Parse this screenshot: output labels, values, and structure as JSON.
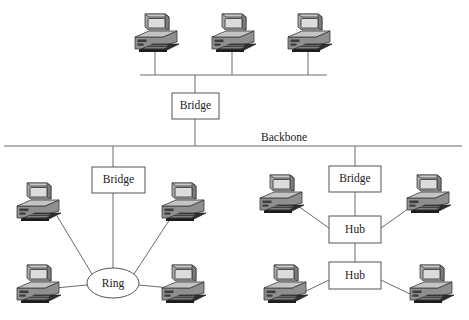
{
  "diagram": {
    "canvas": {
      "width": 469,
      "height": 320
    },
    "colors": {
      "background": "#ffffff",
      "line": "#6b6b6b",
      "box_stroke": "#555555",
      "text": "#1a1a1a",
      "monitor_screen": "#d8d8d8",
      "case_body": "#9a9a9a",
      "case_dark": "#4a4a4a"
    },
    "labels": {
      "backbone": "Backbone",
      "bridge_top": "Bridge",
      "bridge_left": "Bridge",
      "bridge_right": "Bridge",
      "ring": "Ring",
      "hub_upper": "Hub",
      "hub_lower": "Hub"
    },
    "nodes": [
      {
        "id": "bridge-top",
        "type": "box",
        "label": "Bridge",
        "x": 172,
        "y": 93,
        "w": 47,
        "h": 26
      },
      {
        "id": "bridge-left",
        "type": "box",
        "label": "Bridge",
        "x": 92,
        "y": 167,
        "w": 53,
        "h": 26
      },
      {
        "id": "bridge-right",
        "type": "box",
        "label": "Bridge",
        "x": 329,
        "y": 166,
        "w": 52,
        "h": 26
      },
      {
        "id": "hub-upper",
        "type": "box",
        "label": "Hub",
        "x": 329,
        "y": 216,
        "w": 52,
        "h": 27
      },
      {
        "id": "hub-lower",
        "type": "box",
        "label": "Hub",
        "x": 329,
        "y": 262,
        "w": 52,
        "h": 27
      },
      {
        "id": "ring",
        "type": "ellipse",
        "label": "Ring",
        "cx": 113,
        "cy": 283,
        "rx": 26,
        "ry": 15
      }
    ],
    "computers": [
      {
        "id": "pc-top-left",
        "x": 133,
        "y": 11,
        "segment": "top-bus",
        "drop_x": 155
      },
      {
        "id": "pc-top-center",
        "x": 210,
        "y": 11,
        "segment": "top-bus",
        "drop_x": 232
      },
      {
        "id": "pc-top-right",
        "x": 286,
        "y": 11,
        "segment": "top-bus",
        "drop_x": 308
      },
      {
        "id": "pc-ring-upper-left",
        "x": 15,
        "y": 180,
        "segment": "ring"
      },
      {
        "id": "pc-ring-upper-right",
        "x": 160,
        "y": 180,
        "segment": "ring"
      },
      {
        "id": "pc-ring-lower-left",
        "x": 15,
        "y": 262,
        "segment": "ring"
      },
      {
        "id": "pc-ring-lower-right",
        "x": 160,
        "y": 262,
        "segment": "ring"
      },
      {
        "id": "pc-hub-upper-left",
        "x": 258,
        "y": 172,
        "segment": "hub-upper"
      },
      {
        "id": "pc-hub-upper-right",
        "x": 405,
        "y": 172,
        "segment": "hub-upper"
      },
      {
        "id": "pc-hub-lower-left",
        "x": 262,
        "y": 262,
        "segment": "hub-lower"
      },
      {
        "id": "pc-hub-lower-right",
        "x": 408,
        "y": 262,
        "segment": "hub-lower"
      }
    ],
    "buses": [
      {
        "id": "top-bus",
        "x1": 140,
        "y1": 75,
        "x2": 327,
        "y2": 75
      },
      {
        "id": "backbone-bus",
        "x1": 4,
        "y1": 146,
        "x2": 462,
        "y2": 146
      }
    ],
    "connections": [
      {
        "from": "top-bus",
        "to": "bridge-top",
        "kind": "vertical"
      },
      {
        "from": "bridge-top",
        "to": "backbone-bus",
        "kind": "vertical"
      },
      {
        "from": "backbone-bus",
        "to": "bridge-left",
        "kind": "vertical"
      },
      {
        "from": "bridge-left",
        "to": "ring",
        "kind": "vertical"
      },
      {
        "from": "backbone-bus",
        "to": "bridge-right",
        "kind": "vertical"
      },
      {
        "from": "bridge-right",
        "to": "hub-upper",
        "kind": "vertical"
      },
      {
        "from": "hub-upper",
        "to": "hub-lower",
        "kind": "vertical"
      },
      {
        "from": "ring",
        "to": "pc-ring-upper-left",
        "kind": "diagonal"
      },
      {
        "from": "ring",
        "to": "pc-ring-upper-right",
        "kind": "diagonal"
      },
      {
        "from": "ring",
        "to": "pc-ring-lower-left",
        "kind": "horizontal"
      },
      {
        "from": "ring",
        "to": "pc-ring-lower-right",
        "kind": "horizontal"
      },
      {
        "from": "hub-upper",
        "to": "pc-hub-upper-left",
        "kind": "diagonal"
      },
      {
        "from": "hub-upper",
        "to": "pc-hub-upper-right",
        "kind": "diagonal"
      },
      {
        "from": "hub-lower",
        "to": "pc-hub-lower-left",
        "kind": "diagonal"
      },
      {
        "from": "hub-lower",
        "to": "pc-hub-lower-right",
        "kind": "diagonal"
      }
    ],
    "backbone_label_pos": {
      "x": 284,
      "y": 140
    }
  }
}
